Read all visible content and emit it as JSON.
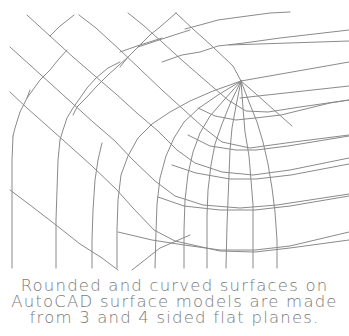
{
  "diagram": {
    "type": "wireframe-surface-mesh",
    "stroke_color": "#8a8a8a",
    "background": "#ffffff",
    "apex_point": [
      241,
      81
    ]
  },
  "caption": {
    "lines": [
      "Rounded and curved surfaces on",
      "AutoCAD surface models are made",
      "from 3 and 4 sided flat planes."
    ],
    "color": "#7a7a7a"
  }
}
